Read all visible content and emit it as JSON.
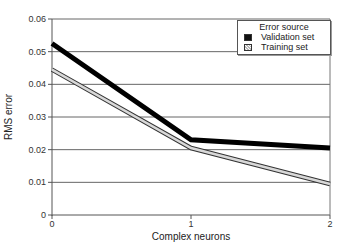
{
  "chart_data": {
    "type": "line",
    "title": "",
    "xlabel": "Complex neurons",
    "ylabel": "RMS error",
    "x": [
      0,
      1,
      2
    ],
    "categories": [
      "0",
      "1",
      "2"
    ],
    "series": [
      {
        "name": "Validation set",
        "values": [
          0.0525,
          0.023,
          0.0205
        ],
        "color": "#000000"
      },
      {
        "name": "Training set",
        "values": [
          0.0445,
          0.0205,
          0.0095
        ],
        "color": "#aaaaaa"
      }
    ],
    "ylim": [
      0,
      0.06
    ],
    "yticks": [
      "0",
      "0.01",
      "0.02",
      "0.03",
      "0.04",
      "0.05",
      "0.06"
    ],
    "xticks": [
      "0",
      "1",
      "2"
    ],
    "grid": true,
    "legend": {
      "title": "Error source",
      "position": "top-right"
    }
  },
  "legend": {
    "title": "Error source",
    "items": [
      {
        "label": "Validation set"
      },
      {
        "label": "Training set"
      }
    ]
  },
  "axes": {
    "xlabel": "Complex neurons",
    "ylabel": "RMS error",
    "yticks": [
      "0",
      "0.01",
      "0.02",
      "0.03",
      "0.04",
      "0.05",
      "0.06"
    ],
    "xticks": [
      "0",
      "1",
      "2"
    ]
  }
}
